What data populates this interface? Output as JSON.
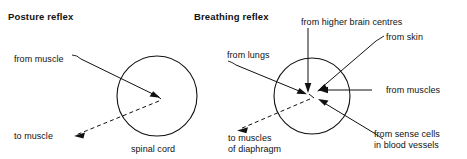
{
  "figure": {
    "panels": [
      {
        "id": "posture-reflex",
        "title": "Posture reflex",
        "center_label": "spinal cord",
        "labels": [
          {
            "id": "from-muscle",
            "text": "from muscle",
            "direction": "afferent"
          },
          {
            "id": "to-muscle",
            "text": "to muscle",
            "direction": "efferent"
          }
        ]
      },
      {
        "id": "breathing-reflex",
        "title": "Breathing reflex",
        "labels": [
          {
            "id": "from-higher-brain-centres",
            "text": "from higher brain centres",
            "direction": "afferent"
          },
          {
            "id": "from-skin",
            "text": "from skin",
            "direction": "afferent"
          },
          {
            "id": "from-muscles",
            "text": "from muscles",
            "direction": "afferent"
          },
          {
            "id": "from-sense-cells-line1",
            "text": "from sense cells",
            "direction": "afferent"
          },
          {
            "id": "from-sense-cells-line2",
            "text": "in blood vessels",
            "direction": "afferent"
          },
          {
            "id": "from-lungs",
            "text": "from lungs",
            "direction": "afferent"
          },
          {
            "id": "to-muscles-line1",
            "text": "to muscles",
            "direction": "efferent"
          },
          {
            "id": "to-muscles-line2",
            "text": "of diaphragm",
            "direction": "efferent"
          }
        ]
      }
    ],
    "colors": {
      "ink": "#111111",
      "background": "#ffffff"
    }
  }
}
